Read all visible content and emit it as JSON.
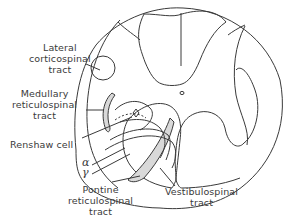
{
  "figure": {
    "labels": {
      "lateral_corticospinal": [
        "Lateral",
        "corticospinal",
        "tract"
      ],
      "medullary_reticulospinal": [
        "Medullary",
        "reticulospinal",
        "tract"
      ],
      "renshaw_cell": "Renshaw cell",
      "alpha": "α",
      "gamma": "γ",
      "pontine_reticulospinal": [
        "Pontine",
        "reticulospinal",
        "tract"
      ],
      "vestibulospinal": [
        "Vestibulospinal",
        "tract"
      ]
    },
    "colors": {
      "line": "#3a3a3a",
      "shading": "#d9d9d9",
      "background": "#ffffff"
    }
  }
}
